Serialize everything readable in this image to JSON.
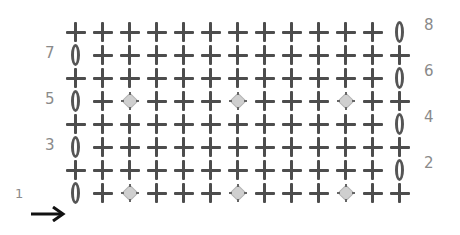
{
  "chart": {
    "title": "",
    "grid": {
      "rows": 8,
      "columns": 13
    },
    "start_marker": {
      "row": 1,
      "label": "1",
      "icon": "arrow-right-icon"
    },
    "symbols": {
      "plus": {
        "name": "single-crochet",
        "icon": "plus-icon",
        "color": "#4d4d4d"
      },
      "chain": {
        "name": "chain",
        "icon": "oval-icon",
        "color": "#555555"
      },
      "bobble": {
        "name": "bobble",
        "icon": "diamond-icon",
        "color": "#cfcfcf"
      }
    },
    "rows": [
      {
        "number": 8,
        "label": "8",
        "label_side": "right",
        "cells": [
          "plus",
          "plus",
          "plus",
          "plus",
          "plus",
          "plus",
          "plus",
          "plus",
          "plus",
          "plus",
          "plus",
          "plus",
          "chain"
        ]
      },
      {
        "number": 7,
        "label": "7",
        "label_side": "left",
        "cells": [
          "chain",
          "plus",
          "plus",
          "plus",
          "plus",
          "plus",
          "plus",
          "plus",
          "plus",
          "plus",
          "plus",
          "plus",
          "plus"
        ]
      },
      {
        "number": 6,
        "label": "6",
        "label_side": "right",
        "cells": [
          "plus",
          "plus",
          "plus",
          "plus",
          "plus",
          "plus",
          "plus",
          "plus",
          "plus",
          "plus",
          "plus",
          "plus",
          "chain"
        ]
      },
      {
        "number": 5,
        "label": "5",
        "label_side": "left",
        "cells": [
          "chain",
          "plus",
          "bobble",
          "plus",
          "plus",
          "plus",
          "bobble",
          "plus",
          "plus",
          "plus",
          "bobble",
          "plus",
          "plus"
        ]
      },
      {
        "number": 4,
        "label": "4",
        "label_side": "right",
        "cells": [
          "plus",
          "plus",
          "plus",
          "plus",
          "plus",
          "plus",
          "plus",
          "plus",
          "plus",
          "plus",
          "plus",
          "plus",
          "chain"
        ]
      },
      {
        "number": 3,
        "label": "3",
        "label_side": "left",
        "cells": [
          "chain",
          "plus",
          "plus",
          "plus",
          "plus",
          "plus",
          "plus",
          "plus",
          "plus",
          "plus",
          "plus",
          "plus",
          "plus"
        ]
      },
      {
        "number": 2,
        "label": "2",
        "label_side": "right",
        "cells": [
          "plus",
          "plus",
          "plus",
          "plus",
          "plus",
          "plus",
          "plus",
          "plus",
          "plus",
          "plus",
          "plus",
          "plus",
          "chain"
        ]
      },
      {
        "number": 1,
        "label": "1",
        "label_side": "left",
        "cells": [
          "chain",
          "plus",
          "bobble",
          "plus",
          "plus",
          "plus",
          "bobble",
          "plus",
          "plus",
          "plus",
          "bobble",
          "plus",
          "plus"
        ]
      }
    ]
  }
}
